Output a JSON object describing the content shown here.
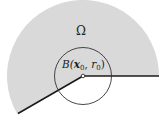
{
  "figure": {
    "type": "geometric-diagram",
    "colors": {
      "region_fill": "#d9d9d9",
      "boundary_stroke": "#1a1a1a",
      "circle_stroke": "#333333",
      "center_point_fill": "#ffffff"
    },
    "geometry": {
      "center": [
        83,
        76
      ],
      "outer_radius": 76,
      "ball_radius": 28,
      "sector_start_angle_deg": 0,
      "sector_end_angle_deg": 210
    },
    "labels": {
      "domain": "Ω",
      "ball_prefix": "B(",
      "ball_x": "x",
      "ball_x_sub": "0",
      "ball_sep": ", ",
      "ball_r": "r",
      "ball_r_sub": "0",
      "ball_suffix": ")"
    }
  }
}
